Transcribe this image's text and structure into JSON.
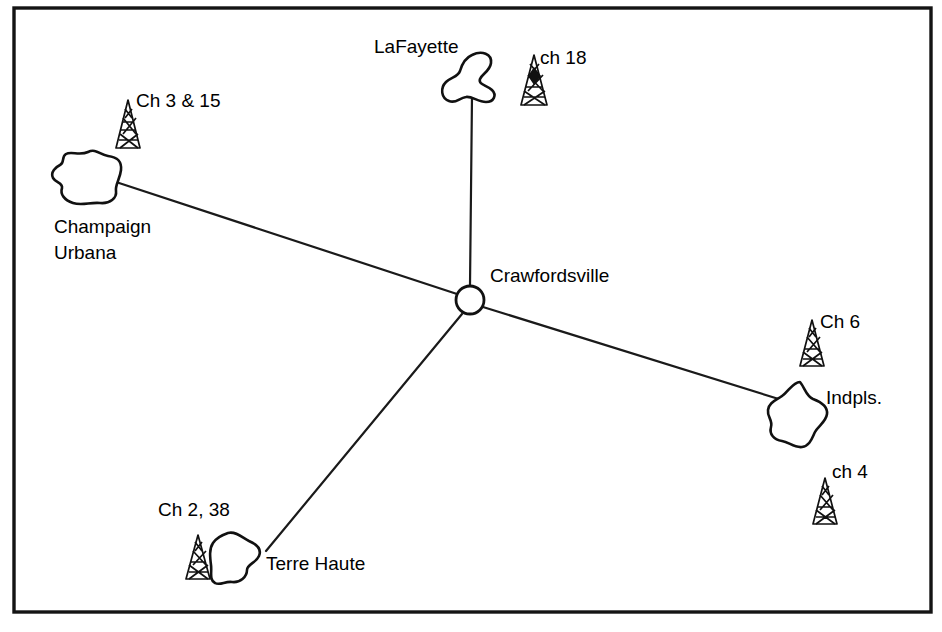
{
  "figure": {
    "type": "diagram",
    "subtype": "network-map",
    "background_color": "#ffffff",
    "line_color": "#111111",
    "frame": {
      "name": "border-frame",
      "x": 14,
      "y": 8,
      "width": 917,
      "height": 604
    }
  },
  "hub": {
    "id": "crawfordsville",
    "label": "Crawfordsville",
    "marker": "open-circle",
    "cx": 470,
    "cy": 300,
    "r": 14,
    "label_x": 490,
    "label_y": 282
  },
  "cities": [
    {
      "id": "lafayette",
      "label": "LaFayette",
      "label_x": 374,
      "label_y": 53,
      "blob_cx": 477,
      "blob_cy": 75
    },
    {
      "id": "champaign-urbana",
      "label": "Champaign",
      "label2": "Urbana",
      "label_x": 54,
      "label_y": 233,
      "label2_x": 54,
      "label2_y": 259,
      "blob_cx": 86,
      "blob_cy": 178
    },
    {
      "id": "indianapolis",
      "label": "Indpls.",
      "label_x": 826,
      "label_y": 404,
      "blob_cx": 800,
      "blob_cy": 414
    },
    {
      "id": "terre-haute",
      "label": "Terre Haute",
      "label_x": 266,
      "label_y": 570,
      "blob_cx": 230,
      "blob_cy": 556
    }
  ],
  "towers": [
    {
      "id": "tower-champaign",
      "label": "Ch 3 & 15",
      "channels": "3, 15",
      "city": "champaign-urbana",
      "x": 118,
      "y": 100,
      "label_x": 136,
      "label_y": 107,
      "filled": false
    },
    {
      "id": "tower-lafayette",
      "label": "ch 18",
      "channels": "18",
      "city": "lafayette",
      "x": 524,
      "y": 55,
      "label_x": 540,
      "label_y": 64,
      "filled": true
    },
    {
      "id": "tower-indianapolis-6",
      "label": "Ch 6",
      "channels": "6",
      "city": "indianapolis",
      "x": 803,
      "y": 320,
      "label_x": 820,
      "label_y": 328,
      "filled": false
    },
    {
      "id": "tower-indianapolis-4",
      "label": "ch 4",
      "channels": "4",
      "city": "indianapolis",
      "x": 816,
      "y": 478,
      "label_x": 832,
      "label_y": 478,
      "filled": false
    },
    {
      "id": "tower-terre-haute",
      "label": "Ch 2, 38",
      "channels": "2, 38",
      "city": "terre-haute",
      "x": 190,
      "y": 535,
      "label_x": 158,
      "label_y": 516,
      "filled": false
    }
  ],
  "links": [
    {
      "id": "link-crawfordsville-lafayette",
      "from": "crawfordsville",
      "to": "lafayette",
      "x1": 470,
      "y1": 286,
      "x2": 472,
      "y2": 96
    },
    {
      "id": "link-crawfordsville-champaign",
      "from": "crawfordsville",
      "to": "champaign-urbana",
      "x1": 457,
      "y1": 294,
      "x2": 116,
      "y2": 182
    },
    {
      "id": "link-crawfordsville-indianapolis",
      "from": "crawfordsville",
      "to": "indianapolis",
      "x1": 483,
      "y1": 307,
      "x2": 782,
      "y2": 400
    },
    {
      "id": "link-crawfordsville-terrehaute",
      "from": "crawfordsville",
      "to": "terre-haute",
      "x1": 462,
      "y1": 314,
      "x2": 266,
      "y2": 551
    }
  ]
}
